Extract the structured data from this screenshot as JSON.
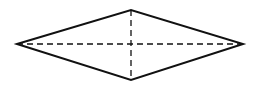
{
  "diagram": {
    "shape": "rhombus",
    "stroke_color": "#111111",
    "background": "#ffffff",
    "vertices": {
      "left": [
        17,
        44
      ],
      "top": [
        131,
        10
      ],
      "right": [
        243,
        44
      ],
      "bottom": [
        131,
        80
      ]
    },
    "outline": {
      "stroke_width": 2
    },
    "diagonals": [
      {
        "name": "horizontal-diagonal",
        "from": "left",
        "to": "right",
        "style": "dashed",
        "dash": "6 4",
        "stroke_width": 1.3
      },
      {
        "name": "vertical-diagonal",
        "from": "top",
        "to": "bottom",
        "style": "dashed",
        "dash": "6 4",
        "stroke_width": 1.3
      }
    ]
  }
}
